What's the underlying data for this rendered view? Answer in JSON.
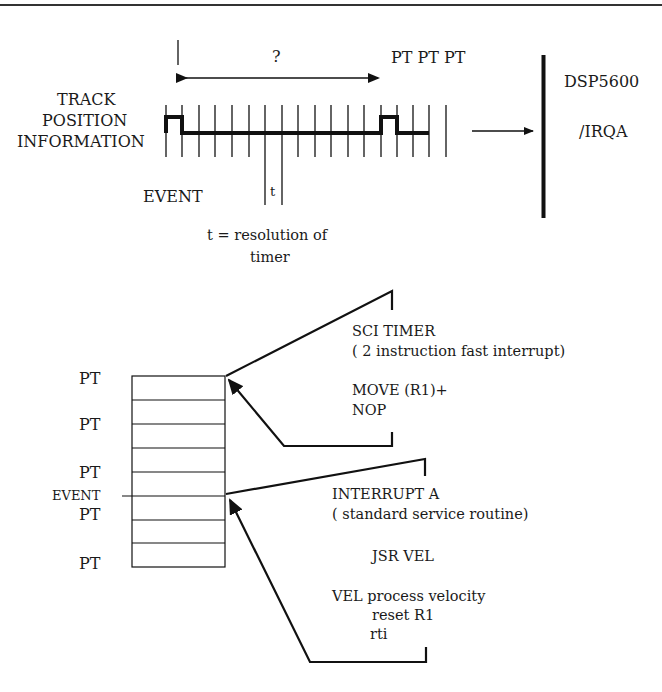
{
  "timing": {
    "question": "?",
    "pt_label": "PT PT PT",
    "track_line1": "TRACK",
    "track_line2": "POSITION",
    "track_line3": "INFORMATION",
    "event": "EVENT",
    "t": "t",
    "resolution_line1": "t = resolution of",
    "resolution_line2": "timer",
    "dsp": "DSP5600",
    "irqa": "/IRQA"
  },
  "buffer": {
    "labels": [
      "PT",
      "PT",
      "PT",
      "PT",
      "PT"
    ],
    "event_label": "EVENT"
  },
  "sci_timer": {
    "title": "SCI TIMER",
    "subtitle": "( 2 instruction fast interrupt)",
    "code1": "MOVE (R1)+",
    "code2": "NOP"
  },
  "interrupt_a": {
    "title": "INTERRUPT A",
    "subtitle": "( standard service routine)",
    "jsr": "JSR   VEL",
    "vel": "VEL  process velocity",
    "reset": "reset R1",
    "rti": "rti"
  },
  "colors": {
    "ink": "#111111",
    "background": "#ffffff"
  }
}
